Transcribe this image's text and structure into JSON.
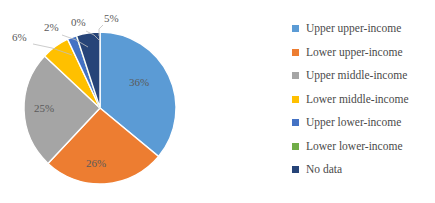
{
  "chart_data": {
    "type": "pie",
    "title": "",
    "subtitle": "",
    "xlabel": "",
    "ylabel": "",
    "grid": false,
    "legend_position": "right",
    "start_angle_deg": 0,
    "direction": "clockwise",
    "categories": [
      "Upper upper-income",
      "Lower upper-income",
      "Upper middle-income",
      "Lower middle-income",
      "Upper lower-income",
      "Lower lower-income",
      "No data"
    ],
    "values": [
      36,
      26,
      25,
      6,
      2,
      0,
      5
    ],
    "data_labels": [
      "36%",
      "26%",
      "25%",
      "6%",
      "2%",
      "0%",
      "5%"
    ],
    "colors": [
      "#5b9bd5",
      "#ed7d31",
      "#a5a5a5",
      "#ffc000",
      "#4472c4",
      "#70ad47",
      "#264478"
    ],
    "label_placement": [
      "inside",
      "inside",
      "inside",
      "outside",
      "outside",
      "outside",
      "outside"
    ]
  },
  "legend": {
    "items": [
      {
        "label": "Upper upper-income",
        "color": "#5b9bd5"
      },
      {
        "label": "Lower upper-income",
        "color": "#ed7d31"
      },
      {
        "label": "Upper middle-income",
        "color": "#a5a5a5"
      },
      {
        "label": "Lower middle-income",
        "color": "#ffc000"
      },
      {
        "label": "Upper lower-income",
        "color": "#4472c4"
      },
      {
        "label": "Lower lower-income",
        "color": "#70ad47"
      },
      {
        "label": "No data",
        "color": "#264478"
      }
    ]
  },
  "labels": {
    "inside": [
      {
        "text": "36%",
        "x": 139,
        "y": 86
      },
      {
        "text": "26%",
        "x": 96,
        "y": 167
      },
      {
        "text": "25%",
        "x": 44,
        "y": 112
      }
    ],
    "outside": [
      {
        "text": "6%",
        "x": 12,
        "y": 41
      },
      {
        "text": "2%",
        "x": 44,
        "y": 31
      },
      {
        "text": "0%",
        "x": 71,
        "y": 26
      },
      {
        "text": "5%",
        "x": 104,
        "y": 22
      }
    ]
  }
}
